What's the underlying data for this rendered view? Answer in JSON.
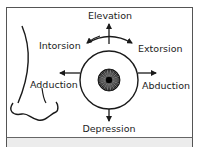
{
  "diagram": {
    "labels": {
      "elevation": "Elevation",
      "depression": "Depression",
      "intorsion": "Intorsion",
      "extorsion": "Extorsion",
      "adduction": "Adduction",
      "abduction": "Abduction"
    },
    "colors": {
      "line": "#1a1a1a",
      "frame": "#555555",
      "strip": "#ececec"
    }
  }
}
